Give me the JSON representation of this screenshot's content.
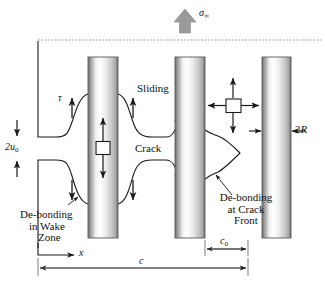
{
  "figure": {
    "kind": "fracture-mechanics-schematic",
    "background": "#ffffff",
    "line_color": "#1a1a1a",
    "fiber_edge_color": "#555555",
    "arrow_fill_gray": "#9a9a9a",
    "dotted_line_color": "#8c8c8c",
    "dimension_line_color": "#6d6d6d"
  },
  "labels": {
    "applied_stress": "σ",
    "applied_stress_sub": "∞",
    "shear_stress": "τ",
    "sliding": "Sliding",
    "crack": "Crack",
    "opening_main": "2u",
    "opening_sub": "0",
    "fiber_diameter_num": "2",
    "fiber_diameter_sym": "R",
    "debond_wake_line1": "De-bonding",
    "debond_wake_line2": "in Wake",
    "debond_wake_line3": "Zone",
    "debond_front_line1": "De-bonding",
    "debond_front_line2": "at Crack",
    "debond_front_line3": "Front",
    "axis_x": "x",
    "crack_length": "c",
    "front_zone_main": "c",
    "front_zone_sub": "0"
  },
  "geometry": {
    "fibers": [
      {
        "id": "fiber-1",
        "x": 88,
        "width": 30,
        "top": 57,
        "bottom": 238
      },
      {
        "id": "fiber-2",
        "x": 175,
        "width": 30,
        "top": 57,
        "bottom": 238
      },
      {
        "id": "fiber-3",
        "x": 262,
        "width": 29,
        "top": 57,
        "bottom": 238
      }
    ],
    "dotted_line_y": 40,
    "left_boundary_x": 38,
    "crack_opening_top_y": 137,
    "crack_opening_bottom_y": 160,
    "dimension_c_y": 268,
    "dimension_c0_y": 249,
    "axis_x_y": 255
  }
}
